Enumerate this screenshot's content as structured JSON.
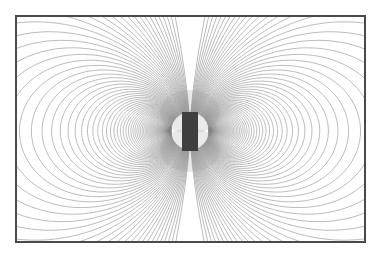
{
  "diagram": {
    "frame": {
      "left": 15,
      "top": 15,
      "right": 364,
      "bottom": 241,
      "border_color": "#4a4a4a"
    },
    "magnet": {
      "center_x": 190,
      "center_y": 131,
      "x1": 182,
      "x2": 198,
      "y1": 112,
      "y2": 151,
      "color": "#3f3f3f",
      "orientation": "vertical"
    },
    "field_lines": {
      "type": "dipole",
      "equation": "r = a / sin^2(theta0) * sin^2(theta)",
      "pole_distance": 19,
      "theta0_start_deg": 3.0,
      "theta0_step_deg": 0.75,
      "theta0_end_deg": 90,
      "color": "#9a9a9a",
      "sides": [
        "left",
        "right"
      ]
    }
  }
}
